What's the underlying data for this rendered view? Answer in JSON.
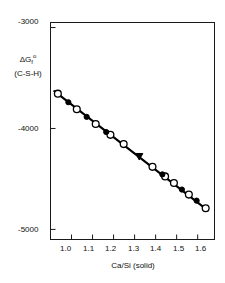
{
  "chart_data": {
    "type": "scatter",
    "title": "",
    "subtitle": "",
    "xlabel": "Ca/Si  (solid)",
    "ylabel_line1_delta": "ΔG",
    "ylabel_line1_sub": "f",
    "ylabel_line1_sup": "o",
    "ylabel_line2": "(C-S-H)",
    "xlim": [
      0.9,
      1.68
    ],
    "ylim": [
      -5100,
      -2950
    ],
    "grid": false,
    "legend": "none",
    "xticks": [
      1.0,
      1.1,
      1.2,
      1.3,
      1.4,
      1.5,
      1.6
    ],
    "xticklabels": [
      "1.0",
      "1.1",
      "1.2",
      "1.3",
      "1.4",
      "1.5",
      "1.6"
    ],
    "yticks": [
      -3000,
      -4000,
      -5000
    ],
    "yticklabels": [
      "-3000",
      "-4000",
      "-5000"
    ],
    "series": [
      {
        "name": "open-circle-markers",
        "marker": "open-circle",
        "color": "#000000",
        "points": [
          {
            "x": 0.935,
            "y": -3655
          },
          {
            "x": 1.025,
            "y": -3810
          },
          {
            "x": 1.115,
            "y": -3955
          },
          {
            "x": 1.185,
            "y": -4063
          },
          {
            "x": 1.248,
            "y": -4155
          },
          {
            "x": 1.385,
            "y": -4380
          },
          {
            "x": 1.445,
            "y": -4475
          },
          {
            "x": 1.487,
            "y": -4540
          },
          {
            "x": 1.558,
            "y": -4655
          },
          {
            "x": 1.638,
            "y": -4790
          }
        ]
      },
      {
        "name": "filled-circle-markers",
        "marker": "filled-circle",
        "color": "#000000",
        "points": [
          {
            "x": 0.985,
            "y": -3740
          },
          {
            "x": 1.072,
            "y": -3885
          },
          {
            "x": 1.165,
            "y": -4035
          },
          {
            "x": 1.432,
            "y": -4455
          },
          {
            "x": 1.525,
            "y": -4605
          },
          {
            "x": 1.595,
            "y": -4715
          }
        ]
      },
      {
        "name": "filled-triangle-markers",
        "marker": "filled-triangle-down",
        "color": "#000000",
        "points": [
          {
            "x": 1.322,
            "y": -4278
          }
        ]
      }
    ],
    "fit_line": {
      "name": "linear-regression-line",
      "x_start": 0.918,
      "y_start": -3630,
      "x_end": 1.648,
      "y_end": -4812,
      "color": "#000000"
    }
  }
}
